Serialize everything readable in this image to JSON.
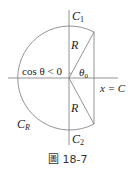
{
  "diagram": {
    "type": "contour-figure",
    "labels": {
      "c1": "C",
      "c1_sub": "1",
      "c2": "C",
      "c2_sub": "2",
      "cr": "C",
      "cr_sub": "R",
      "r_top": "R",
      "r_bottom": "R",
      "theta0": "θ",
      "theta0_sub": "0",
      "cos_condition": "cos θ < 0",
      "line_label": "x = C"
    },
    "caption": "圖 18-7",
    "colors": {
      "line": "#7a7a7a",
      "text": "#222222"
    }
  }
}
